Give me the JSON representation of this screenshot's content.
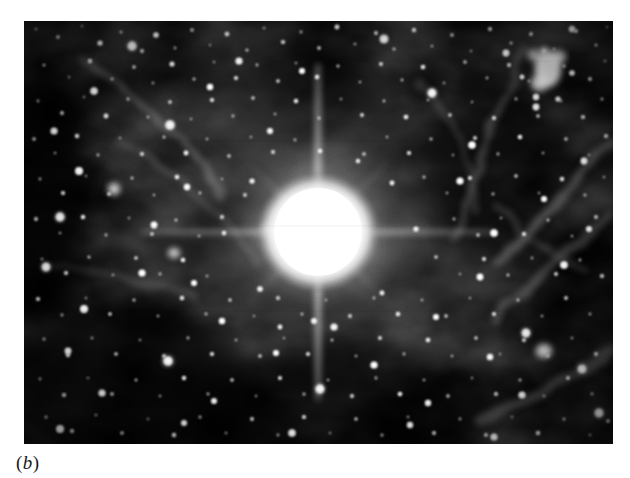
{
  "figure": {
    "caption_open_paren": "(",
    "caption_label": "b",
    "caption_close_paren": ")",
    "caption_full": "(b)",
    "page_background": "#ffffff",
    "ink_color": "#1a1a1a"
  },
  "plate": {
    "kind": "astronomical-photograph",
    "description": "Grayscale halftone photographic plate of a dense star field containing one extremely bright saturated star with four-way diffraction spikes, surrounded by filamentary nebulosity.",
    "frame": {
      "x": 24,
      "y": 21,
      "width": 589,
      "height": 423
    },
    "sky_background": "#050505",
    "star_color": "#ffffff",
    "nebula_color": "#9a9a9a",
    "bright_star": {
      "label": "central-saturated-star",
      "cx": 294,
      "cy": 211,
      "core_radius": 46,
      "halo_radius": 112,
      "spike_vertical_length": 168,
      "spike_horizontal_length": 152,
      "spike_diagonal_length": 96
    },
    "features": [
      {
        "name": "bright-star-clump-upper-right",
        "cx": 524,
        "cy": 49,
        "r": 16
      },
      {
        "name": "nebular-filament-right",
        "cx": 520,
        "cy": 220
      },
      {
        "name": "nebular-filament-lower-right",
        "cx": 560,
        "cy": 400
      },
      {
        "name": "faint-nebulosity-upper-left",
        "cx": 150,
        "cy": 90
      },
      {
        "name": "dark-lane-left-edge",
        "cx": 30,
        "cy": 180
      },
      {
        "name": "dark-region-lower-left",
        "cx": 110,
        "cy": 360
      }
    ]
  }
}
